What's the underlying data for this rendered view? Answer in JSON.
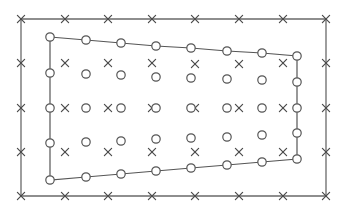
{
  "diagram": {
    "width": 344,
    "height": 215,
    "colors": {
      "background": "#ffffff",
      "outer_line": "#6a6a6a",
      "inner_line": "#555555",
      "cross": "#4a4a4a",
      "circle_stroke": "#555555",
      "circle_fill": "#ffffff"
    },
    "outer_boundary": {
      "shape": "rectangle",
      "corners": [
        [
          21,
          19
        ],
        [
          326,
          19
        ],
        [
          326,
          196
        ],
        [
          21,
          196
        ]
      ]
    },
    "outer_crosses": [
      [
        21,
        19
      ],
      [
        65,
        19
      ],
      [
        108,
        19
      ],
      [
        152,
        19
      ],
      [
        195,
        19
      ],
      [
        239,
        19
      ],
      [
        283,
        19
      ],
      [
        326,
        19
      ],
      [
        21,
        63
      ],
      [
        326,
        63
      ],
      [
        21,
        108
      ],
      [
        326,
        108
      ],
      [
        21,
        152
      ],
      [
        326,
        152
      ],
      [
        21,
        196
      ],
      [
        65,
        196
      ],
      [
        108,
        196
      ],
      [
        152,
        196
      ],
      [
        195,
        196
      ],
      [
        239,
        196
      ],
      [
        283,
        196
      ],
      [
        326,
        196
      ]
    ],
    "interior_crosses": [
      [
        65,
        63
      ],
      [
        108,
        63
      ],
      [
        152,
        63
      ],
      [
        195,
        64
      ],
      [
        239,
        64
      ],
      [
        283,
        63
      ],
      [
        65,
        108
      ],
      [
        108,
        108
      ],
      [
        152,
        108
      ],
      [
        195,
        108
      ],
      [
        239,
        108
      ],
      [
        283,
        108
      ],
      [
        65,
        152
      ],
      [
        108,
        152
      ],
      [
        152,
        152
      ],
      [
        195,
        152
      ],
      [
        239,
        152
      ],
      [
        283,
        152
      ]
    ],
    "inner_polygon": {
      "top_edge": [
        [
          50,
          37
        ],
        [
          86,
          40
        ],
        [
          121,
          43
        ],
        [
          156,
          46
        ],
        [
          191,
          48
        ],
        [
          227,
          51
        ],
        [
          262,
          53
        ],
        [
          297,
          56
        ]
      ],
      "right_edge": [
        [
          297,
          56
        ],
        [
          297,
          82
        ],
        [
          297,
          108
        ],
        [
          297,
          133
        ],
        [
          297,
          159
        ]
      ],
      "bottom_edge": [
        [
          297,
          159
        ],
        [
          262,
          162
        ],
        [
          227,
          165
        ],
        [
          191,
          168
        ],
        [
          156,
          171
        ],
        [
          121,
          174
        ],
        [
          86,
          177
        ],
        [
          50,
          180
        ]
      ],
      "left_edge": [
        [
          50,
          180
        ],
        [
          50,
          143
        ],
        [
          50,
          108
        ],
        [
          50,
          73
        ],
        [
          50,
          37
        ]
      ]
    },
    "interior_circles": [
      [
        86,
        74
      ],
      [
        121,
        75
      ],
      [
        156,
        77
      ],
      [
        191,
        78
      ],
      [
        227,
        79
      ],
      [
        262,
        80
      ],
      [
        86,
        108
      ],
      [
        121,
        108
      ],
      [
        156,
        108
      ],
      [
        191,
        108
      ],
      [
        227,
        108
      ],
      [
        262,
        108
      ],
      [
        86,
        142
      ],
      [
        121,
        141
      ],
      [
        156,
        139
      ],
      [
        191,
        138
      ],
      [
        227,
        137
      ],
      [
        262,
        135
      ]
    ],
    "marker_sizes": {
      "circle_radius": 4.2,
      "cross_half": 3.6
    }
  }
}
